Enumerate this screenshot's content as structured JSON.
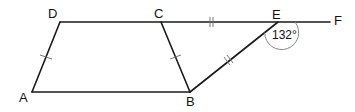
{
  "diagram": {
    "type": "geometry",
    "colors": {
      "line": "#1a1a1a",
      "tick": "#777777",
      "arc": "#888888",
      "text": "#111111"
    },
    "points": {
      "A": {
        "label": "A",
        "x": 32,
        "y": 92
      },
      "B": {
        "label": "B",
        "x": 190,
        "y": 92
      },
      "C": {
        "label": "C",
        "x": 161,
        "y": 22
      },
      "D": {
        "label": "D",
        "x": 60,
        "y": 22
      },
      "E": {
        "label": "E",
        "x": 278,
        "y": 22
      },
      "F": {
        "label": "F",
        "x": 330,
        "y": 22
      }
    },
    "segments": [
      "AB",
      "BC",
      "CD",
      "DA",
      "DF",
      "BE"
    ],
    "equal_marks": {
      "single": [
        "AD",
        "BC"
      ],
      "double": [
        "CE",
        "BE"
      ]
    },
    "angle": {
      "vertex": "E",
      "between": [
        "B",
        "F"
      ],
      "label": "132°"
    }
  }
}
